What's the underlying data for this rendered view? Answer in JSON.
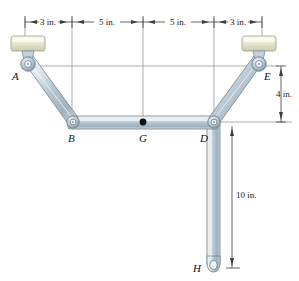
{
  "figure": {
    "units": "in.",
    "width": 299,
    "height": 281
  },
  "colors": {
    "member_light": "#e8eef2",
    "member_mid": "#b9c8d2",
    "member_dark": "#8fa3b0",
    "member_edge": "#6e818e",
    "collar_light": "#f2f1e4",
    "collar_mid": "#dedcc6",
    "collar_edge": "#a8a68e",
    "pin_ring": "#7d8f9b",
    "pin_core": "#ffffff",
    "dim_line": "#4a4a4a",
    "ext_line": "#777777",
    "text": "#111111",
    "dot_g": "#111111"
  },
  "dimensions": {
    "horizontal": [
      {
        "id": "dim-3in-left",
        "label": "3 in.",
        "value": 3,
        "x_start": 25,
        "x_end": 72,
        "y": 22,
        "text_x": 48
      },
      {
        "id": "dim-5in-left",
        "label": "5 in.",
        "value": 5,
        "x_start": 72,
        "x_end": 143,
        "y": 22,
        "text_x": 107
      },
      {
        "id": "dim-5in-right",
        "label": "5 in.",
        "value": 5,
        "x_start": 143,
        "x_end": 214,
        "y": 22,
        "text_x": 178
      },
      {
        "id": "dim-3in-right",
        "label": "3 in.",
        "value": 3,
        "x_start": 214,
        "x_end": 262,
        "y": 22,
        "text_x": 238
      }
    ],
    "vertical": [
      {
        "id": "dim-4in",
        "label": "4 in.",
        "value": 4,
        "x": 281,
        "y_start": 66,
        "y_end": 122,
        "text_x": 284,
        "text_y": 97
      },
      {
        "id": "dim-10in",
        "label": "10 in.",
        "value": 10,
        "x": 232,
        "y_start": 126,
        "y_end": 268,
        "text_x": 236,
        "text_y": 198
      }
    ]
  },
  "points": [
    {
      "id": "A",
      "label": "A",
      "x": 28,
      "y": 66,
      "label_x": 12,
      "label_y": 78,
      "type": "pin-in-collar"
    },
    {
      "id": "B",
      "label": "B",
      "x": 72,
      "y": 122,
      "label_x": 66,
      "label_y": 141,
      "type": "pin"
    },
    {
      "id": "G",
      "label": "G",
      "x": 143,
      "y": 122,
      "label_x": 137,
      "label_y": 141,
      "type": "load-point"
    },
    {
      "id": "D",
      "label": "D",
      "x": 214,
      "y": 122,
      "label_x": 203,
      "label_y": 141,
      "type": "pin"
    },
    {
      "id": "E",
      "label": "E",
      "x": 259,
      "y": 66,
      "label_x": 262,
      "label_y": 79,
      "type": "pin-in-collar"
    },
    {
      "id": "H",
      "label": "H",
      "x": 214,
      "y": 266,
      "label_x": 196,
      "label_y": 271,
      "type": "eye-end"
    }
  ],
  "members": [
    {
      "id": "member-AB",
      "from": "A",
      "to": "B",
      "label": "link A-B"
    },
    {
      "id": "member-BD",
      "from": "B",
      "to": "D",
      "label": "link B-D"
    },
    {
      "id": "member-DE",
      "from": "D",
      "to": "E",
      "label": "link D-E"
    },
    {
      "id": "member-DH",
      "from": "D",
      "to": "H",
      "label": "link D-H"
    }
  ],
  "supports": [
    {
      "id": "collar-A",
      "label": "collar at A",
      "x": 28,
      "y": 44,
      "width": 34,
      "height": 16
    },
    {
      "id": "collar-E",
      "label": "collar at E",
      "x": 259,
      "y": 44,
      "width": 34,
      "height": 16
    }
  ],
  "reference_lines": {
    "horizontal_AE": {
      "y": 66,
      "x_start": 22,
      "x_end": 278
    },
    "horizontal_BD": {
      "y": 122,
      "x_start": 214,
      "x_end": 290
    },
    "extension_ticks_y_top": 18,
    "extension_ticks_y_bottom": 28
  }
}
